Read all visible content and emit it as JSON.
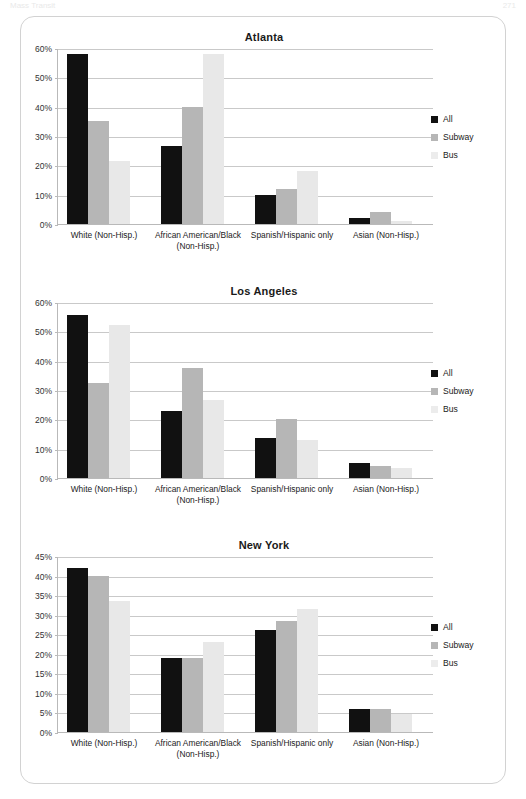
{
  "page_header": {
    "left_text": "Mass Transit",
    "right_text": "271"
  },
  "legend": {
    "items": [
      {
        "label": "All",
        "color": "#111111",
        "key": "all"
      },
      {
        "label": "Subway",
        "color": "#b6b6b6",
        "key": "subway"
      },
      {
        "label": "Bus",
        "color": "#ececec",
        "key": "bus"
      }
    ]
  },
  "categories": [
    "White (Non-Hisp.)",
    "African American/Black (Non-Hisp.)",
    "Spanish/Hispanic only",
    "Asian (Non-Hisp.)"
  ],
  "chart_data": [
    {
      "type": "bar",
      "title": "Atlanta",
      "xlabel": "",
      "ylabel": "",
      "ylim": [
        0,
        60
      ],
      "ytick_step": 10,
      "ticks": [
        "0%",
        "10%",
        "20%",
        "30%",
        "40%",
        "50%",
        "60%"
      ],
      "grid": true,
      "legend_position": "right",
      "categories": [
        "White (Non-Hisp.)",
        "African American/Black (Non-Hisp.)",
        "Spanish/Hispanic only",
        "Asian (Non-Hisp.)"
      ],
      "series": [
        {
          "name": "All",
          "values": [
            58,
            26.5,
            10,
            2
          ]
        },
        {
          "name": "Subway",
          "values": [
            35,
            40,
            12,
            4
          ]
        },
        {
          "name": "Bus",
          "values": [
            21.5,
            58,
            18,
            1
          ]
        }
      ]
    },
    {
      "type": "bar",
      "title": "Los Angeles",
      "xlabel": "",
      "ylabel": "",
      "ylim": [
        0,
        60
      ],
      "ytick_step": 10,
      "ticks": [
        "0%",
        "10%",
        "20%",
        "30%",
        "40%",
        "50%",
        "60%"
      ],
      "grid": true,
      "legend_position": "right",
      "categories": [
        "White (Non-Hisp.)",
        "African American/Black (Non-Hisp.)",
        "Spanish/Hispanic only",
        "Asian (Non-Hisp.)"
      ],
      "series": [
        {
          "name": "All",
          "values": [
            55.5,
            23,
            13.5,
            5
          ]
        },
        {
          "name": "Subway",
          "values": [
            32.5,
            37.5,
            20,
            4
          ]
        },
        {
          "name": "Bus",
          "values": [
            52,
            26.5,
            13,
            3.5
          ]
        }
      ]
    },
    {
      "type": "bar",
      "title": "New York",
      "xlabel": "",
      "ylabel": "",
      "ylim": [
        0,
        45
      ],
      "ytick_step": 5,
      "ticks": [
        "0%",
        "5%",
        "10%",
        "15%",
        "20%",
        "25%",
        "30%",
        "35%",
        "40%",
        "45%"
      ],
      "grid": true,
      "legend_position": "right",
      "categories": [
        "White (Non-Hisp.)",
        "African American/Black (Non-Hisp.)",
        "Spanish/Hispanic only",
        "Asian (Non-Hisp.)"
      ],
      "series": [
        {
          "name": "All",
          "values": [
            42,
            19,
            26,
            6
          ]
        },
        {
          "name": "Subway",
          "values": [
            40,
            19,
            28.5,
            6
          ]
        },
        {
          "name": "Bus",
          "values": [
            33.5,
            23,
            31.5,
            4.5
          ]
        }
      ]
    }
  ]
}
